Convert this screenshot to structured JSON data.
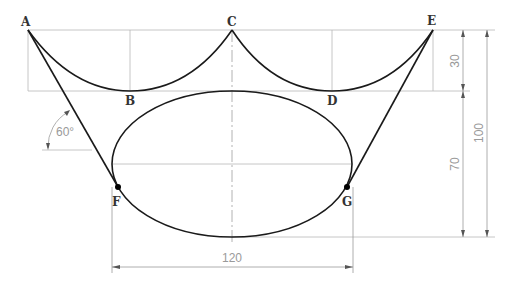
{
  "drawing": {
    "points": {
      "A": {
        "label": "A",
        "x": 28,
        "y": 30
      },
      "B": {
        "label": "B",
        "x": 130,
        "y": 91
      },
      "C": {
        "label": "C",
        "x": 232,
        "y": 30
      },
      "D": {
        "label": "D",
        "x": 332,
        "y": 91
      },
      "E": {
        "label": "E",
        "x": 433,
        "y": 30
      },
      "F": {
        "label": "F",
        "x": 118,
        "y": 187
      },
      "G": {
        "label": "G",
        "x": 347,
        "y": 187
      }
    },
    "dimensions": {
      "top_height": "30",
      "total_height": "100",
      "ellipse_height": "70",
      "ellipse_width": "120",
      "angle": "60°"
    },
    "colors": {
      "curve": "#1a1a1a",
      "construction": "#b8b8b8",
      "dimension": "#9a9a9a",
      "label": "#333333"
    }
  }
}
